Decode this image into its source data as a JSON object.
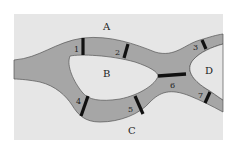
{
  "diagram": {
    "colors": {
      "background": "#ffffff",
      "land": "#e6e6e6",
      "river": "#a6a6a6",
      "river_outline": "#555555",
      "bridge": "#111111"
    },
    "land_regions": [
      {
        "id": "A",
        "label": "A"
      },
      {
        "id": "B",
        "label": "B"
      },
      {
        "id": "C",
        "label": "C"
      },
      {
        "id": "D",
        "label": "D"
      }
    ],
    "bridges": [
      {
        "id": "1",
        "label": "1",
        "connects": [
          "A",
          "B"
        ]
      },
      {
        "id": "2",
        "label": "2",
        "connects": [
          "A",
          "B"
        ]
      },
      {
        "id": "3",
        "label": "3",
        "connects": [
          "A",
          "D"
        ]
      },
      {
        "id": "4",
        "label": "4",
        "connects": [
          "B",
          "C"
        ]
      },
      {
        "id": "5",
        "label": "5",
        "connects": [
          "B",
          "C"
        ]
      },
      {
        "id": "6",
        "label": "6",
        "connects": [
          "B",
          "D"
        ]
      },
      {
        "id": "7",
        "label": "7",
        "connects": [
          "C",
          "D"
        ]
      }
    ]
  }
}
